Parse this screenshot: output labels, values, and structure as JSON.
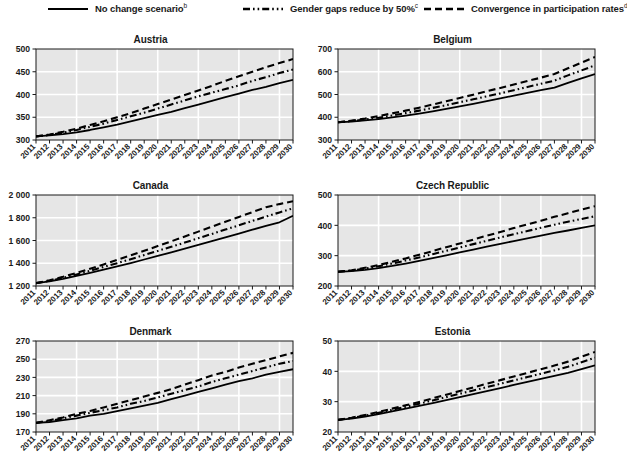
{
  "legend": {
    "position": "top",
    "items": [
      {
        "label": "No change scenario",
        "superscript": "b",
        "style": "solid",
        "icon": "solid-line-icon"
      },
      {
        "label": "Gender gaps reduce by 50%",
        "superscript": "c",
        "style": "dashdotdot",
        "icon": "dash-dot-line-icon"
      },
      {
        "label": "Convergence in participation rates",
        "superscript": "d",
        "style": "dashed",
        "icon": "dashed-line-icon"
      }
    ]
  },
  "chart_data": [
    {
      "type": "line",
      "title": "Austria",
      "xlabel": "",
      "ylabel": "",
      "grid": true,
      "xlim": [
        2011,
        2030
      ],
      "ylim": [
        300,
        500
      ],
      "yticks": [
        300,
        350,
        400,
        450,
        500
      ],
      "ytick_labels": [
        "300",
        "350",
        "400",
        "450",
        "500"
      ],
      "x": [
        2011,
        2012,
        2013,
        2014,
        2015,
        2016,
        2017,
        2018,
        2019,
        2020,
        2021,
        2022,
        2023,
        2024,
        2025,
        2026,
        2027,
        2028,
        2029,
        2030
      ],
      "series": [
        {
          "name": "No change scenario",
          "style": "solid",
          "values": [
            308,
            310,
            313,
            317,
            322,
            328,
            334,
            341,
            348,
            355,
            362,
            370,
            378,
            386,
            394,
            402,
            410,
            417,
            425,
            432
          ]
        },
        {
          "name": "Gender gaps reduce by 50%",
          "style": "dashdotdot",
          "values": [
            308,
            311,
            316,
            322,
            329,
            336,
            344,
            352,
            360,
            369,
            378,
            387,
            396,
            404,
            412,
            420,
            430,
            438,
            447,
            455
          ]
        },
        {
          "name": "Convergence in participation rates",
          "style": "dashed",
          "values": [
            308,
            312,
            318,
            325,
            333,
            341,
            350,
            359,
            369,
            379,
            389,
            399,
            409,
            419,
            430,
            440,
            450,
            460,
            469,
            478
          ]
        }
      ]
    },
    {
      "type": "line",
      "title": "Belgium",
      "xlabel": "",
      "ylabel": "",
      "grid": true,
      "xlim": [
        2011,
        2030
      ],
      "ylim": [
        300,
        700
      ],
      "yticks": [
        300,
        400,
        500,
        600,
        700
      ],
      "ytick_labels": [
        "300",
        "400",
        "500",
        "600",
        "700"
      ],
      "x": [
        2011,
        2012,
        2013,
        2014,
        2015,
        2016,
        2017,
        2018,
        2019,
        2020,
        2021,
        2022,
        2023,
        2024,
        2025,
        2026,
        2027,
        2028,
        2029,
        2030
      ],
      "series": [
        {
          "name": "No change scenario",
          "style": "solid",
          "values": [
            378,
            381,
            386,
            392,
            399,
            407,
            416,
            426,
            437,
            448,
            459,
            471,
            483,
            495,
            507,
            519,
            530,
            551,
            571,
            590
          ]
        },
        {
          "name": "Gender gaps reduce by 50%",
          "style": "dashdotdot",
          "values": [
            378,
            383,
            390,
            398,
            408,
            418,
            429,
            441,
            453,
            466,
            479,
            492,
            505,
            519,
            533,
            547,
            561,
            584,
            606,
            628
          ]
        },
        {
          "name": "Convergence in participation rates",
          "style": "dashed",
          "values": [
            378,
            385,
            394,
            405,
            417,
            429,
            442,
            456,
            470,
            485,
            499,
            514,
            529,
            544,
            559,
            574,
            590,
            615,
            640,
            665
          ]
        }
      ]
    },
    {
      "type": "line",
      "title": "Canada",
      "xlabel": "",
      "ylabel": "",
      "grid": true,
      "xlim": [
        2011,
        2030
      ],
      "ylim": [
        1200,
        2000
      ],
      "yticks": [
        1200,
        1400,
        1600,
        1800,
        2000
      ],
      "ytick_labels": [
        "1 200",
        "1 400",
        "1 600",
        "1 800",
        "2 000"
      ],
      "x": [
        2011,
        2012,
        2013,
        2014,
        2015,
        2016,
        2017,
        2018,
        2019,
        2020,
        2021,
        2022,
        2023,
        2024,
        2025,
        2026,
        2027,
        2028,
        2029,
        2030
      ],
      "series": [
        {
          "name": "No change scenario",
          "style": "solid",
          "values": [
            1225,
            1240,
            1262,
            1288,
            1315,
            1343,
            1372,
            1402,
            1433,
            1464,
            1496,
            1528,
            1561,
            1594,
            1628,
            1661,
            1695,
            1728,
            1760,
            1818
          ]
        },
        {
          "name": "Gender gaps reduce by 50%",
          "style": "dashdotdot",
          "values": [
            1225,
            1245,
            1272,
            1302,
            1334,
            1367,
            1401,
            1436,
            1472,
            1508,
            1545,
            1582,
            1620,
            1658,
            1696,
            1734,
            1772,
            1810,
            1847,
            1883
          ]
        },
        {
          "name": "Convergence in participation rates",
          "style": "dashed",
          "values": [
            1225,
            1250,
            1281,
            1315,
            1352,
            1390,
            1429,
            1469,
            1510,
            1551,
            1593,
            1635,
            1678,
            1721,
            1764,
            1807,
            1850,
            1892,
            1920,
            1945
          ]
        }
      ]
    },
    {
      "type": "line",
      "title": "Czech Republic",
      "xlabel": "",
      "ylabel": "",
      "grid": true,
      "xlim": [
        2011,
        2030
      ],
      "ylim": [
        200,
        500
      ],
      "yticks": [
        200,
        300,
        400,
        500
      ],
      "ytick_labels": [
        "200",
        "300",
        "400",
        "500"
      ],
      "x": [
        2011,
        2012,
        2013,
        2014,
        2015,
        2016,
        2017,
        2018,
        2019,
        2020,
        2021,
        2022,
        2023,
        2024,
        2025,
        2026,
        2027,
        2028,
        2029,
        2030
      ],
      "series": [
        {
          "name": "No change scenario",
          "style": "solid",
          "values": [
            247,
            249,
            253,
            259,
            266,
            274,
            283,
            292,
            301,
            311,
            320,
            330,
            339,
            348,
            357,
            366,
            375,
            383,
            392,
            400
          ]
        },
        {
          "name": "Gender gaps reduce by 50%",
          "style": "dashdotdot",
          "values": [
            247,
            251,
            257,
            265,
            274,
            284,
            294,
            305,
            316,
            327,
            338,
            349,
            360,
            371,
            381,
            392,
            402,
            412,
            421,
            430
          ]
        },
        {
          "name": "Convergence in participation rates",
          "style": "dashed",
          "values": [
            247,
            252,
            260,
            269,
            280,
            291,
            303,
            315,
            328,
            340,
            353,
            366,
            378,
            391,
            403,
            415,
            428,
            440,
            452,
            463
          ]
        }
      ]
    },
    {
      "type": "line",
      "title": "Denmark",
      "xlabel": "",
      "ylabel": "",
      "grid": true,
      "xlim": [
        2011,
        2030
      ],
      "ylim": [
        170,
        270
      ],
      "yticks": [
        170,
        190,
        210,
        230,
        250,
        270
      ],
      "ytick_labels": [
        "170",
        "190",
        "210",
        "230",
        "250",
        "270"
      ],
      "x": [
        2011,
        2012,
        2013,
        2014,
        2015,
        2016,
        2017,
        2018,
        2019,
        2020,
        2021,
        2022,
        2023,
        2024,
        2025,
        2026,
        2027,
        2028,
        2029,
        2030
      ],
      "series": [
        {
          "name": "No change scenario",
          "style": "solid",
          "values": [
            180,
            181,
            183,
            185,
            188,
            190,
            193,
            196,
            199,
            202,
            206,
            210,
            214,
            218,
            222,
            226,
            229,
            233,
            236,
            239
          ]
        },
        {
          "name": "Gender gaps reduce by 50%",
          "style": "dashdotdot",
          "values": [
            180,
            182,
            185,
            188,
            191,
            194,
            197,
            201,
            204,
            208,
            212,
            216,
            220,
            225,
            229,
            233,
            237,
            241,
            245,
            248
          ]
        },
        {
          "name": "Convergence in participation rates",
          "style": "dashed",
          "values": [
            180,
            183,
            186,
            190,
            193,
            197,
            201,
            205,
            209,
            213,
            217,
            222,
            227,
            232,
            236,
            241,
            245,
            249,
            253,
            257
          ]
        }
      ]
    },
    {
      "type": "line",
      "title": "Estonia",
      "xlabel": "",
      "ylabel": "",
      "grid": true,
      "xlim": [
        2011,
        2030
      ],
      "ylim": [
        20,
        50
      ],
      "yticks": [
        20,
        30,
        40,
        50
      ],
      "ytick_labels": [
        "20",
        "30",
        "40",
        "50"
      ],
      "x": [
        2011,
        2012,
        2013,
        2014,
        2015,
        2016,
        2017,
        2018,
        2019,
        2020,
        2021,
        2022,
        2023,
        2024,
        2025,
        2026,
        2027,
        2028,
        2029,
        2030
      ],
      "series": [
        {
          "name": "No change scenario",
          "style": "solid",
          "values": [
            24.0,
            24.4,
            25.1,
            25.9,
            26.8,
            27.7,
            28.6,
            29.5,
            30.5,
            31.5,
            32.5,
            33.5,
            34.5,
            35.5,
            36.5,
            37.5,
            38.5,
            39.5,
            40.7,
            42.0
          ]
        },
        {
          "name": "Gender gaps reduce by 50%",
          "style": "dashdotdot",
          "values": [
            24.0,
            24.6,
            25.4,
            26.3,
            27.3,
            28.3,
            29.3,
            30.4,
            31.5,
            32.6,
            33.7,
            34.8,
            35.9,
            37.0,
            38.1,
            39.2,
            40.3,
            41.5,
            43.0,
            44.5
          ]
        },
        {
          "name": "Convergence in participation rates",
          "style": "dashed",
          "values": [
            24.0,
            24.7,
            25.6,
            26.6,
            27.7,
            28.8,
            29.9,
            31.1,
            32.3,
            33.5,
            34.7,
            35.9,
            37.1,
            38.3,
            39.5,
            40.7,
            41.9,
            43.2,
            44.8,
            46.4
          ]
        }
      ]
    }
  ],
  "colors": {
    "plot_background": "#e6e6e6",
    "gridline": "#ffffff",
    "axis": "#1a1a1a",
    "line": "#000000",
    "page_background": "#ffffff"
  }
}
